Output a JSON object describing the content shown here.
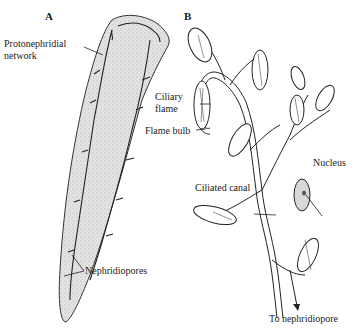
{
  "figure": {
    "panels": [
      {
        "id": "A",
        "label": "A"
      },
      {
        "id": "B",
        "label": "B"
      }
    ],
    "panel_a": {
      "labels": {
        "protonephridial": [
          "Protonephridial",
          "network"
        ],
        "nephridiopores": "Nephridiopores"
      }
    },
    "panel_b": {
      "labels": {
        "ciliary_flame": [
          "Ciliary",
          "flame"
        ],
        "flame_bulb": "Flame bulb",
        "nucleus": "Nucleus",
        "ciliated_canal": "Ciliated canal",
        "to_nephridiopore": "To nephridiopore"
      }
    },
    "colors": {
      "body_fill": "#e2e2e2",
      "ink": "#1a1a1a",
      "background": "#ffffff"
    }
  }
}
